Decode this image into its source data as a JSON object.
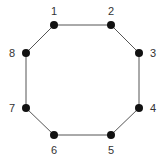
{
  "diagram": {
    "type": "cycle-graph",
    "colors": {
      "node": "#111111",
      "edge": "#555555",
      "label": "#333333"
    },
    "nodes": [
      {
        "id": "1",
        "label": "1",
        "x": 54,
        "y": 25,
        "lx": 54,
        "ly": 11
      },
      {
        "id": "2",
        "label": "2",
        "x": 111,
        "y": 25,
        "lx": 111,
        "ly": 11
      },
      {
        "id": "3",
        "label": "3",
        "x": 139,
        "y": 53,
        "lx": 153,
        "ly": 53
      },
      {
        "id": "4",
        "label": "4",
        "x": 139,
        "y": 108,
        "lx": 153,
        "ly": 108
      },
      {
        "id": "5",
        "label": "5",
        "x": 111,
        "y": 135,
        "lx": 111,
        "ly": 150
      },
      {
        "id": "6",
        "label": "6",
        "x": 54,
        "y": 135,
        "lx": 54,
        "ly": 150
      },
      {
        "id": "7",
        "label": "7",
        "x": 26,
        "y": 108,
        "lx": 12,
        "ly": 108
      },
      {
        "id": "8",
        "label": "8",
        "x": 26,
        "y": 53,
        "lx": 12,
        "ly": 53
      }
    ],
    "edges": [
      [
        "1",
        "2"
      ],
      [
        "2",
        "3"
      ],
      [
        "3",
        "4"
      ],
      [
        "4",
        "5"
      ],
      [
        "5",
        "6"
      ],
      [
        "6",
        "7"
      ],
      [
        "7",
        "8"
      ],
      [
        "8",
        "1"
      ]
    ]
  }
}
